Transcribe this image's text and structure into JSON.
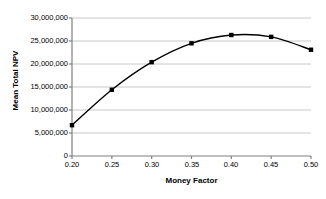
{
  "chart_data": {
    "type": "line",
    "title": "",
    "xlabel": "Money Factor",
    "ylabel": "Mean Total NPV",
    "x": [
      0.2,
      0.25,
      0.3,
      0.35,
      0.4,
      0.45,
      0.5
    ],
    "values": [
      6700000,
      14400000,
      20400000,
      24500000,
      26300000,
      25900000,
      23100000
    ],
    "series": [
      {
        "name": "Mean Total NPV",
        "values": [
          6700000,
          14400000,
          20400000,
          24500000,
          26300000,
          25900000,
          23100000
        ]
      }
    ],
    "xlim": [
      0.2,
      0.5
    ],
    "ylim": [
      0,
      30000000
    ],
    "xticks": [
      0.2,
      0.25,
      0.3,
      0.35,
      0.4,
      0.45,
      0.5
    ],
    "xtick_labels": [
      "0.20",
      "0.25",
      "0.30",
      "0.35",
      "0.40",
      "0.45",
      "0.50"
    ],
    "yticks": [
      0,
      5000000,
      10000000,
      15000000,
      20000000,
      25000000,
      30000000
    ],
    "ytick_labels": [
      "0",
      "5,000,000",
      "10,000,000",
      "15,000,000",
      "20,000,000",
      "25,000,000",
      "30,000,000"
    ],
    "grid": "horizontal",
    "legend": "none",
    "line_color": "#000000",
    "marker_color": "#000000",
    "marker_shape": "square",
    "grid_color": "#c8c8c8",
    "axis_color": "#808080",
    "background": "#ffffff"
  }
}
